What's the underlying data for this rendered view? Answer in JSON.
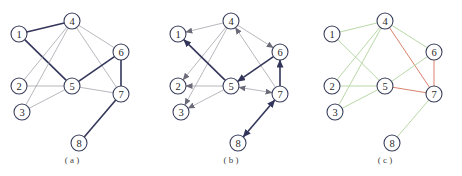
{
  "figure": {
    "panels": [
      {
        "id": "a",
        "caption": "( a )",
        "offset_x": 0,
        "type": "undirected",
        "edges": [
          {
            "from": 1,
            "to": 4,
            "style": "thick"
          },
          {
            "from": 1,
            "to": 5,
            "style": "thick"
          },
          {
            "from": 4,
            "to": 2,
            "style": "thin"
          },
          {
            "from": 4,
            "to": 3,
            "style": "thin"
          },
          {
            "from": 4,
            "to": 6,
            "style": "thin"
          },
          {
            "from": 4,
            "to": 7,
            "style": "thin"
          },
          {
            "from": 5,
            "to": 6,
            "style": "thick"
          },
          {
            "from": 6,
            "to": 7,
            "style": "thick"
          },
          {
            "from": 2,
            "to": 5,
            "style": "thin"
          },
          {
            "from": 3,
            "to": 5,
            "style": "thin"
          },
          {
            "from": 5,
            "to": 7,
            "style": "thin"
          },
          {
            "from": 7,
            "to": 8,
            "style": "thick"
          }
        ]
      },
      {
        "id": "b",
        "caption": "( b )",
        "offset_x": 159,
        "type": "directed",
        "edges": [
          {
            "from": 4,
            "to": 1,
            "style": "thin",
            "arrow": "end"
          },
          {
            "from": 4,
            "to": 2,
            "style": "thin",
            "arrow": "end"
          },
          {
            "from": 4,
            "to": 3,
            "style": "thin",
            "arrow": "end"
          },
          {
            "from": 4,
            "to": 6,
            "style": "thin",
            "arrow": "end"
          },
          {
            "from": 7,
            "to": 4,
            "style": "thin",
            "arrow": "end"
          },
          {
            "from": 5,
            "to": 1,
            "style": "thick",
            "arrow": "end"
          },
          {
            "from": 6,
            "to": 5,
            "style": "thick",
            "arrow": "end"
          },
          {
            "from": 7,
            "to": 6,
            "style": "thick",
            "arrow": "end"
          },
          {
            "from": 5,
            "to": 2,
            "style": "thin",
            "arrow": "end"
          },
          {
            "from": 5,
            "to": 3,
            "style": "thin",
            "arrow": "end"
          },
          {
            "from": 5,
            "to": 7,
            "style": "thin",
            "arrow": "both"
          },
          {
            "from": 7,
            "to": 8,
            "style": "thick",
            "arrow": "both"
          }
        ]
      },
      {
        "id": "c",
        "caption": "( c )",
        "offset_x": 313,
        "type": "colored",
        "edges": [
          {
            "from": 1,
            "to": 4,
            "color": "green"
          },
          {
            "from": 1,
            "to": 5,
            "color": "green"
          },
          {
            "from": 4,
            "to": 2,
            "color": "green"
          },
          {
            "from": 4,
            "to": 3,
            "color": "green"
          },
          {
            "from": 4,
            "to": 6,
            "color": "green"
          },
          {
            "from": 4,
            "to": 7,
            "color": "red"
          },
          {
            "from": 5,
            "to": 6,
            "color": "green"
          },
          {
            "from": 6,
            "to": 7,
            "color": "red"
          },
          {
            "from": 2,
            "to": 5,
            "color": "green"
          },
          {
            "from": 3,
            "to": 5,
            "color": "green"
          },
          {
            "from": 5,
            "to": 7,
            "color": "red"
          },
          {
            "from": 7,
            "to": 8,
            "color": "green"
          }
        ]
      }
    ],
    "nodes": [
      {
        "id": 1,
        "label": "1",
        "x": 19,
        "y": 34
      },
      {
        "id": 2,
        "label": "2",
        "x": 19,
        "y": 86
      },
      {
        "id": 3,
        "label": "3",
        "x": 22,
        "y": 112
      },
      {
        "id": 4,
        "label": "4",
        "x": 72,
        "y": 21
      },
      {
        "id": 5,
        "label": "5",
        "x": 72,
        "y": 86
      },
      {
        "id": 6,
        "label": "6",
        "x": 121,
        "y": 52
      },
      {
        "id": 7,
        "label": "7",
        "x": 121,
        "y": 94
      },
      {
        "id": 8,
        "label": "8",
        "x": 79,
        "y": 143
      }
    ],
    "node_radius": 8,
    "caption_y": 163,
    "colors": {
      "node_stroke": "#3a3f5c",
      "thin_edge": "#9a9aa2",
      "thick_edge": "#33365a",
      "green_edge": "#b9d8a8",
      "red_edge": "#d9826e"
    }
  }
}
